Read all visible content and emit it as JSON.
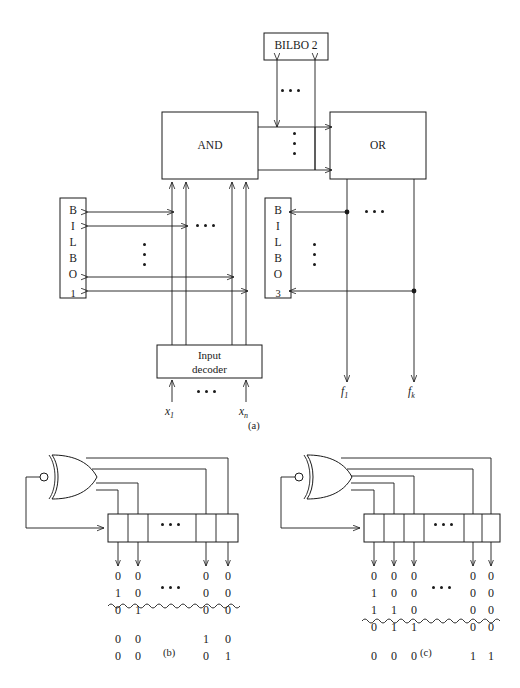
{
  "figure": {
    "caption": "",
    "panels": [
      {
        "id": "a",
        "label": "(a)"
      },
      {
        "id": "b",
        "label": "(b)"
      },
      {
        "id": "c",
        "label": "(c)"
      }
    ]
  },
  "panel_a": {
    "blocks": {
      "bilbo2": "BILBO 2",
      "and": "AND",
      "or": "OR",
      "input_decoder_line1": "Input",
      "input_decoder_line2": "decoder",
      "bilbo1_letters": [
        "B",
        "I",
        "L",
        "B",
        "O"
      ],
      "bilbo1_index": "1",
      "bilbo3_letters": [
        "B",
        "I",
        "L",
        "B",
        "O"
      ],
      "bilbo3_index": "3"
    },
    "signals": {
      "input_first": "x",
      "input_first_sub": "1",
      "input_last": "x",
      "input_last_sub": "n",
      "output_first": "f",
      "output_first_sub": "1",
      "output_last": "f",
      "output_last_sub": "k"
    }
  },
  "panel_b": {
    "register_cells": 5,
    "columns": 4,
    "rows_above": 3,
    "rows_below": 2,
    "bits_above": [
      [
        "0",
        "0",
        "0",
        "0"
      ],
      [
        "1",
        "0",
        "0",
        "0"
      ],
      [
        "0",
        "1",
        "0",
        "0"
      ]
    ],
    "bits_below": [
      [
        "0",
        "0",
        "1",
        "0"
      ],
      [
        "0",
        "0",
        "0",
        "1"
      ]
    ]
  },
  "panel_c": {
    "register_cells": 6,
    "columns": 5,
    "rows_above": 4,
    "rows_below": 1,
    "bits_above": [
      [
        "0",
        "0",
        "0",
        "0",
        "0"
      ],
      [
        "1",
        "0",
        "0",
        "0",
        "0"
      ],
      [
        "1",
        "1",
        "0",
        "0",
        "0"
      ],
      [
        "0",
        "1",
        "1",
        "0",
        "0"
      ]
    ],
    "bits_below": [
      [
        "0",
        "0",
        "0",
        "1",
        "1"
      ]
    ]
  },
  "colors": {
    "ink": "#1a1a1a",
    "paper": "#ffffff"
  }
}
